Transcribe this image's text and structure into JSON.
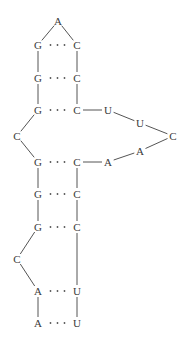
{
  "diagram": {
    "type": "rna-secondary-structure",
    "text_color": "#3a3a3a",
    "line_color": "#555555",
    "nucleotides": [
      {
        "id": "n1",
        "label": "A",
        "x": 38,
        "y": 323
      },
      {
        "id": "n2",
        "label": "A",
        "x": 38,
        "y": 291
      },
      {
        "id": "n3",
        "label": "C",
        "x": 17,
        "y": 259
      },
      {
        "id": "n4",
        "label": "G",
        "x": 38,
        "y": 227
      },
      {
        "id": "n5",
        "label": "G",
        "x": 38,
        "y": 194
      },
      {
        "id": "n6",
        "label": "G",
        "x": 38,
        "y": 162
      },
      {
        "id": "n7",
        "label": "C",
        "x": 17,
        "y": 136
      },
      {
        "id": "n8",
        "label": "G",
        "x": 38,
        "y": 110
      },
      {
        "id": "n9",
        "label": "G",
        "x": 38,
        "y": 78
      },
      {
        "id": "n10",
        "label": "G",
        "x": 38,
        "y": 45
      },
      {
        "id": "n11",
        "label": "A",
        "x": 58,
        "y": 21
      },
      {
        "id": "n12",
        "label": "C",
        "x": 77,
        "y": 45
      },
      {
        "id": "n13",
        "label": "C",
        "x": 77,
        "y": 78
      },
      {
        "id": "n14",
        "label": "C",
        "x": 77,
        "y": 110
      },
      {
        "id": "n15",
        "label": "U",
        "x": 108,
        "y": 110
      },
      {
        "id": "n16",
        "label": "U",
        "x": 140,
        "y": 123
      },
      {
        "id": "n17",
        "label": "C",
        "x": 173,
        "y": 136
      },
      {
        "id": "n18",
        "label": "A",
        "x": 140,
        "y": 151
      },
      {
        "id": "n19",
        "label": "A",
        "x": 108,
        "y": 162
      },
      {
        "id": "n20",
        "label": "C",
        "x": 77,
        "y": 162
      },
      {
        "id": "n21",
        "label": "C",
        "x": 77,
        "y": 194
      },
      {
        "id": "n22",
        "label": "C",
        "x": 77,
        "y": 227
      },
      {
        "id": "n23",
        "label": "U",
        "x": 77,
        "y": 291
      },
      {
        "id": "n24",
        "label": "U",
        "x": 77,
        "y": 323
      }
    ],
    "backbone": [
      [
        "n1",
        "n2"
      ],
      [
        "n2",
        "n3"
      ],
      [
        "n3",
        "n4"
      ],
      [
        "n4",
        "n5"
      ],
      [
        "n5",
        "n6"
      ],
      [
        "n6",
        "n7"
      ],
      [
        "n7",
        "n8"
      ],
      [
        "n8",
        "n9"
      ],
      [
        "n9",
        "n10"
      ],
      [
        "n10",
        "n11"
      ],
      [
        "n11",
        "n12"
      ],
      [
        "n12",
        "n13"
      ],
      [
        "n13",
        "n14"
      ],
      [
        "n14",
        "n15"
      ],
      [
        "n15",
        "n16"
      ],
      [
        "n16",
        "n17"
      ],
      [
        "n17",
        "n18"
      ],
      [
        "n18",
        "n19"
      ],
      [
        "n19",
        "n20"
      ],
      [
        "n20",
        "n21"
      ],
      [
        "n21",
        "n22"
      ],
      [
        "n22",
        "n23"
      ],
      [
        "n23",
        "n24"
      ]
    ],
    "base_pairs": [
      [
        "n10",
        "n12"
      ],
      [
        "n9",
        "n13"
      ],
      [
        "n8",
        "n14"
      ],
      [
        "n6",
        "n20"
      ],
      [
        "n5",
        "n21"
      ],
      [
        "n4",
        "n22"
      ],
      [
        "n2",
        "n23"
      ],
      [
        "n1",
        "n24"
      ]
    ]
  }
}
